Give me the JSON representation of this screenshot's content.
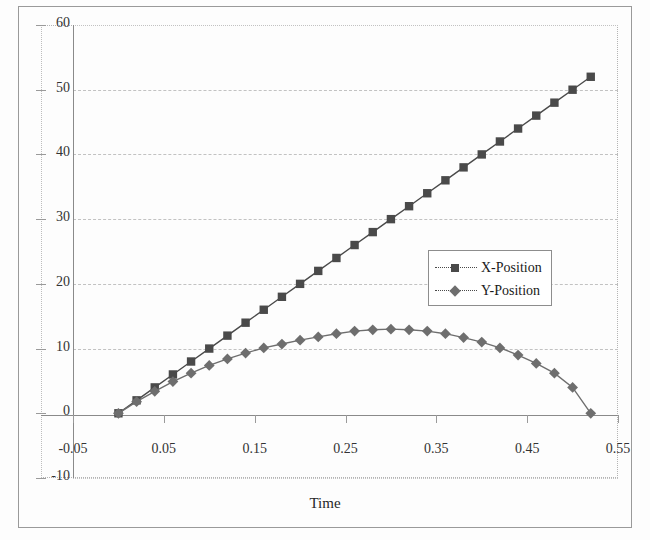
{
  "chart_data": {
    "type": "line",
    "title": "",
    "subtitle": "",
    "xlabel": "Time",
    "ylabel": "",
    "xlim": [
      -0.05,
      0.55
    ],
    "ylim": [
      -10,
      60
    ],
    "xticks": [
      "-0.05",
      "0.05",
      "0.15",
      "0.25",
      "0.35",
      "0.45",
      "0.55"
    ],
    "xtick_values": [
      -0.05,
      0.05,
      0.15,
      0.25,
      0.35,
      0.45,
      0.55
    ],
    "yticks": [
      "-10",
      "0",
      "10",
      "20",
      "30",
      "40",
      "50",
      "60"
    ],
    "ytick_values": [
      -10,
      0,
      10,
      20,
      30,
      40,
      50,
      60
    ],
    "grid": true,
    "grid_axis": "y",
    "legend_position": "center-right",
    "x": [
      0.0,
      0.02,
      0.04,
      0.06,
      0.08,
      0.1,
      0.12,
      0.14,
      0.16,
      0.18,
      0.2,
      0.22,
      0.24,
      0.26,
      0.28,
      0.3,
      0.32,
      0.34,
      0.36,
      0.38,
      0.4,
      0.42,
      0.44,
      0.46,
      0.48,
      0.5,
      0.52
    ],
    "series": [
      {
        "name": "X-Position",
        "marker": "square",
        "color": "#4a4a4a",
        "values": [
          0.0,
          2.0,
          4.0,
          6.0,
          8.0,
          10.0,
          12.0,
          14.0,
          16.0,
          18.0,
          20.0,
          22.0,
          24.0,
          26.0,
          28.0,
          30.0,
          32.0,
          34.0,
          36.0,
          38.0,
          40.0,
          42.0,
          44.0,
          46.0,
          48.0,
          50.0,
          52.0
        ]
      },
      {
        "name": "Y-Position",
        "marker": "diamond",
        "color": "#6e6e6e",
        "values": [
          0.0,
          1.8,
          3.4,
          4.9,
          6.2,
          7.4,
          8.4,
          9.3,
          10.1,
          10.7,
          11.3,
          11.8,
          12.3,
          12.7,
          12.9,
          13.0,
          12.9,
          12.7,
          12.3,
          11.7,
          11.0,
          10.1,
          9.0,
          7.7,
          6.2,
          4.0,
          0.0
        ]
      }
    ]
  },
  "legend": {
    "items": [
      {
        "label": "X-Position",
        "marker": "square"
      },
      {
        "label": "Y-Position",
        "marker": "diamond"
      }
    ]
  },
  "axis": {
    "x_title": "Time"
  }
}
